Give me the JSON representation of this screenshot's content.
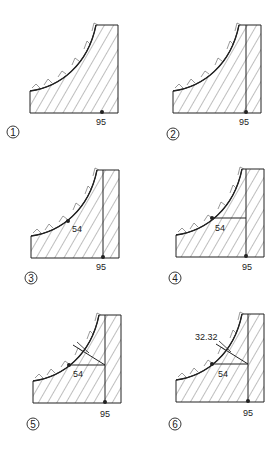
{
  "diagram": {
    "panels": [
      {
        "step": "1",
        "labels": {
          "base": "95"
        }
      },
      {
        "step": "2",
        "labels": {
          "base": "95"
        }
      },
      {
        "step": "3",
        "labels": {
          "base": "95",
          "point": "54"
        }
      },
      {
        "step": "4",
        "labels": {
          "base": "95",
          "point": "54"
        }
      },
      {
        "step": "5",
        "labels": {
          "base": "95",
          "point": "54"
        }
      },
      {
        "step": "6",
        "labels": {
          "base": "95",
          "point": "54",
          "tangent": "32.32"
        }
      }
    ],
    "colors": {
      "line": "#222222",
      "hatch": "#444444",
      "background": "#ffffff"
    }
  }
}
